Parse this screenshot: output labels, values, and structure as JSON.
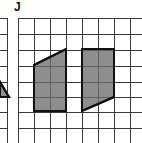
{
  "figure": {
    "label": "J",
    "colors": {
      "grid": "#3a3a3a",
      "shape_fill": "#8e8e8e",
      "shape_stroke": "#111111",
      "background": "#ffffff"
    },
    "grid": {
      "cell_size": 16,
      "x_lines": [
        18,
        34,
        50,
        66,
        82,
        98,
        114,
        130
      ],
      "y_lines": [
        18,
        34,
        50,
        66,
        82,
        97,
        112,
        128
      ],
      "left_panel_x_line": 7
    },
    "shapes": [
      {
        "name": "left-parallelogram",
        "points": "34,65 66,49 66,111 34,111"
      },
      {
        "name": "right-parallelogram",
        "points": "82,49 114,49 114,97 82,111"
      },
      {
        "name": "partial-triangle",
        "points": "0,82 0,97 9,97"
      }
    ]
  }
}
